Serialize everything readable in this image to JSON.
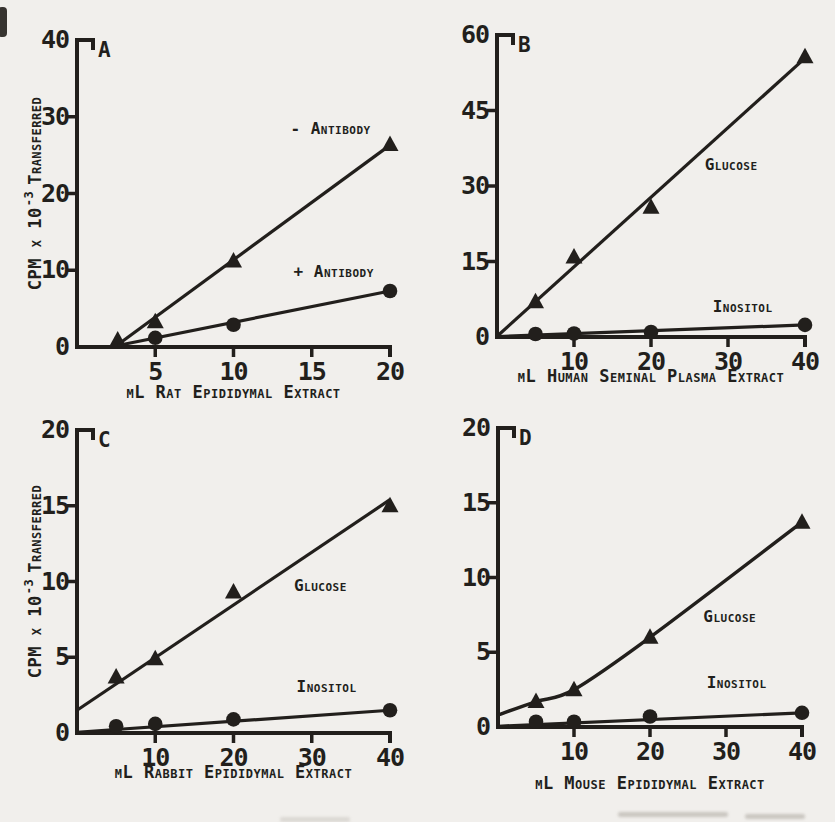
{
  "figure": {
    "paper_color": "#f1efec",
    "ink_color": "#221f1c"
  },
  "chart_data": [
    {
      "panel": "A",
      "type": "scatter",
      "title": "",
      "xlabel": "µL Rat Epididymal Extract",
      "ylabel": {
        "pre": "CPM x 10",
        "sup": "-3",
        "post": "Transferred"
      },
      "xlim": [
        0,
        20
      ],
      "ylim": [
        0,
        40
      ],
      "xticks": [
        5,
        10,
        15,
        20
      ],
      "yticks": [
        0,
        10,
        20,
        30,
        40
      ],
      "grid": false,
      "series": [
        {
          "name": "- Antibody",
          "marker": "triangle",
          "points": [
            [
              2.6,
              0.9
            ],
            [
              5,
              3.3
            ],
            [
              10,
              11.2
            ],
            [
              20,
              26.4
            ]
          ],
          "trend": [
            [
              2.6,
              0.3
            ],
            [
              20,
              26.3
            ]
          ]
        },
        {
          "name": "+ Antibody",
          "marker": "circle",
          "points": [
            [
              5,
              1.2
            ],
            [
              10,
              2.9
            ],
            [
              20,
              7.3
            ]
          ],
          "trend": [
            [
              2.6,
              0.2
            ],
            [
              20,
              7.3
            ]
          ]
        }
      ],
      "annotations": [
        {
          "text": "- Antibody",
          "x": 16.2,
          "y": 27.7
        },
        {
          "text": "+ Antibody",
          "x": 16.4,
          "y": 9.1
        }
      ]
    },
    {
      "panel": "B",
      "type": "scatter",
      "title": "",
      "xlabel": "µL Human Seminal Plasma Extract",
      "ylabel": null,
      "xlim": [
        0,
        40
      ],
      "ylim": [
        0,
        60
      ],
      "xticks": [
        10,
        20,
        30,
        40
      ],
      "yticks": [
        0,
        15,
        30,
        45,
        60
      ],
      "grid": false,
      "series": [
        {
          "name": "Glucose",
          "marker": "triangle",
          "points": [
            [
              5,
              7.0
            ],
            [
              10,
              15.9
            ],
            [
              20,
              25.8
            ],
            [
              40,
              55.7
            ]
          ],
          "trend": [
            [
              0.2,
              0.4
            ],
            [
              40,
              55.4
            ]
          ]
        },
        {
          "name": "Inositol",
          "marker": "circle",
          "points": [
            [
              5,
              0.6
            ],
            [
              10,
              0.7
            ],
            [
              20,
              1.0
            ],
            [
              40,
              2.4
            ]
          ],
          "trend": [
            [
              0.2,
              0.1
            ],
            [
              40,
              2.4
            ]
          ]
        }
      ],
      "annotations": [
        {
          "text": "Glucose",
          "x": 30.4,
          "y": 33.2
        },
        {
          "text": "Inositol",
          "x": 31.9,
          "y": 5.0
        }
      ]
    },
    {
      "panel": "C",
      "type": "scatter",
      "title": "",
      "xlabel": "µL Rabbit Epididymal Extract",
      "ylabel": {
        "pre": "CPM x 10",
        "sup": "-3",
        "post": "Transferred"
      },
      "xlim": [
        0,
        40
      ],
      "ylim": [
        0,
        20
      ],
      "xticks": [
        10,
        20,
        30,
        40
      ],
      "yticks": [
        0,
        5,
        10,
        15,
        20
      ],
      "grid": false,
      "series": [
        {
          "name": "Glucose",
          "marker": "triangle",
          "points": [
            [
              5,
              3.7
            ],
            [
              10,
              4.9
            ],
            [
              20,
              9.3
            ],
            [
              40,
              15.0
            ]
          ],
          "trend": [
            [
              0,
              1.5
            ],
            [
              40,
              15.4
            ]
          ]
        },
        {
          "name": "Inositol",
          "marker": "circle",
          "points": [
            [
              5,
              0.45
            ],
            [
              10,
              0.6
            ],
            [
              20,
              0.9
            ],
            [
              40,
              1.5
            ]
          ],
          "trend": [
            [
              0,
              0.05
            ],
            [
              40,
              1.5
            ]
          ]
        }
      ],
      "annotations": [
        {
          "text": "Glucose",
          "x": 31.1,
          "y": 9.4
        },
        {
          "text": "Inositol",
          "x": 31.9,
          "y": 2.7
        }
      ]
    },
    {
      "panel": "D",
      "type": "scatter",
      "title": "",
      "xlabel": "µL Mouse Epididymal Extract",
      "ylabel": null,
      "xlim": [
        0,
        40
      ],
      "ylim": [
        0,
        20
      ],
      "xticks": [
        10,
        20,
        30,
        40
      ],
      "yticks": [
        0,
        5,
        10,
        15,
        20
      ],
      "grid": false,
      "series": [
        {
          "name": "Glucose",
          "marker": "triangle",
          "points": [
            [
              5,
              1.7
            ],
            [
              10,
              2.5
            ],
            [
              20,
              6.0
            ],
            [
              40,
              13.7
            ]
          ],
          "curve": [
            [
              0,
              0.8
            ],
            [
              5,
              1.7
            ],
            [
              10,
              2.5
            ],
            [
              20,
              6.0
            ],
            [
              40,
              13.7
            ]
          ]
        },
        {
          "name": "Inositol",
          "marker": "circle",
          "points": [
            [
              5,
              0.35
            ],
            [
              10,
              0.35
            ],
            [
              20,
              0.7
            ],
            [
              40,
              0.95
            ]
          ],
          "trend": [
            [
              0,
              0.05
            ],
            [
              40,
              0.95
            ]
          ]
        }
      ],
      "annotations": [
        {
          "text": "Glucose",
          "x": 30.5,
          "y": 7.0
        },
        {
          "text": "Inositol",
          "x": 31.4,
          "y": 2.6
        }
      ]
    }
  ]
}
